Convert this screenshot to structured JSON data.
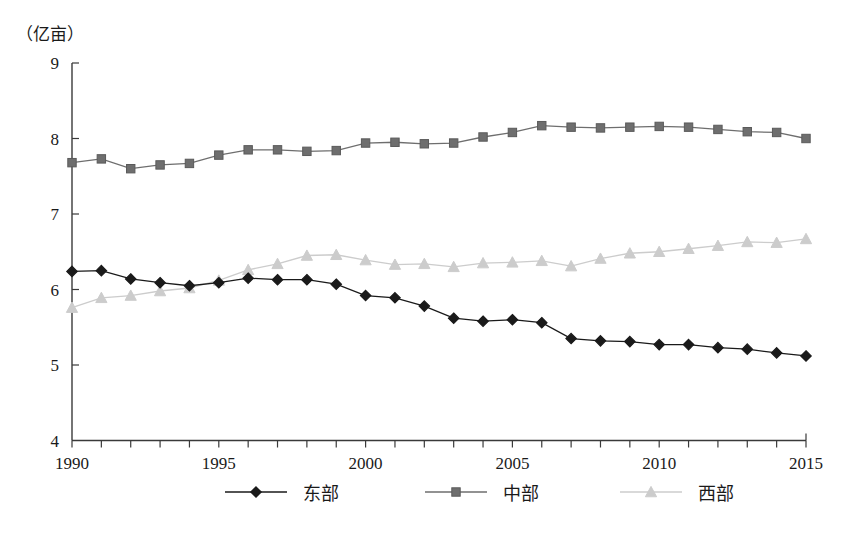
{
  "chart_data": {
    "type": "line",
    "title": "",
    "unit_label": "（亿亩）",
    "xlabel": "",
    "ylabel": "",
    "xlim": [
      1990,
      2015
    ],
    "ylim": [
      4,
      9
    ],
    "y_ticks": [
      4,
      5,
      6,
      7,
      8,
      9
    ],
    "x_ticks": [
      1990,
      1991,
      1992,
      1993,
      1994,
      1995,
      1996,
      1997,
      1998,
      1999,
      2000,
      2001,
      2002,
      2003,
      2004,
      2005,
      2006,
      2007,
      2008,
      2009,
      2010,
      2011,
      2012,
      2013,
      2014,
      2015
    ],
    "x_tick_labels": [
      "1990",
      "",
      "",
      "",
      "",
      "1995",
      "",
      "",
      "",
      "",
      "2000",
      "",
      "",
      "",
      "",
      "2005",
      "",
      "",
      "",
      "",
      "2010",
      "",
      "",
      "",
      "",
      "2015"
    ],
    "grid": false,
    "legend_position": "bottom",
    "x": [
      1990,
      1991,
      1992,
      1993,
      1994,
      1995,
      1996,
      1997,
      1998,
      1999,
      2000,
      2001,
      2002,
      2003,
      2004,
      2005,
      2006,
      2007,
      2008,
      2009,
      2010,
      2011,
      2012,
      2013,
      2014,
      2015
    ],
    "series": [
      {
        "name": "东部",
        "marker": "diamond",
        "color": "#1a1a1a",
        "values": [
          6.24,
          6.25,
          6.14,
          6.09,
          6.05,
          6.09,
          6.15,
          6.13,
          6.13,
          6.07,
          5.92,
          5.89,
          5.78,
          5.62,
          5.58,
          5.6,
          5.56,
          5.35,
          5.32,
          5.31,
          5.27,
          5.27,
          5.23,
          5.21,
          5.16,
          5.12
        ]
      },
      {
        "name": "中部",
        "marker": "square",
        "color": "#6e6e6e",
        "values": [
          7.68,
          7.73,
          7.6,
          7.65,
          7.67,
          7.78,
          7.85,
          7.85,
          7.83,
          7.84,
          7.94,
          7.95,
          7.93,
          7.94,
          8.02,
          8.08,
          8.17,
          8.15,
          8.14,
          8.15,
          8.16,
          8.15,
          8.12,
          8.09,
          8.08,
          8.0
        ]
      },
      {
        "name": "西部",
        "marker": "triangle",
        "color": "#cccccc",
        "values": [
          5.76,
          5.89,
          5.92,
          5.98,
          6.02,
          6.12,
          6.26,
          6.34,
          6.45,
          6.46,
          6.39,
          6.33,
          6.34,
          6.3,
          6.35,
          6.36,
          6.38,
          6.31,
          6.41,
          6.48,
          6.5,
          6.54,
          6.58,
          6.63,
          6.62,
          6.67
        ]
      }
    ]
  },
  "legend": {
    "items": [
      {
        "label": "东部"
      },
      {
        "label": "中部"
      },
      {
        "label": "西部"
      }
    ]
  }
}
